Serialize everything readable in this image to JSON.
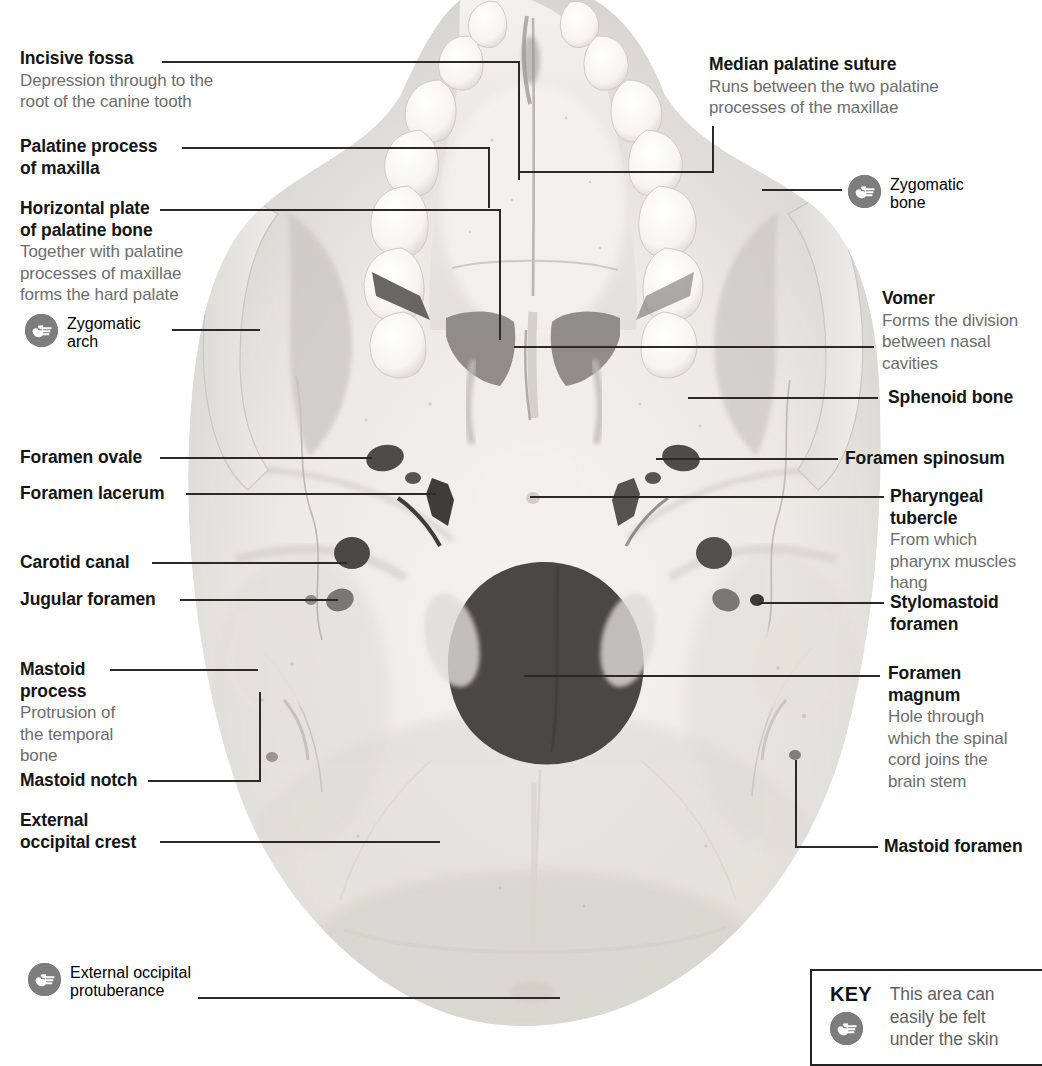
{
  "figure": {
    "bone_color": "#eceae6",
    "foramen_color": "#4a4a4a",
    "leader_color": "#2a2a2a",
    "title_color": "#151515",
    "desc_color": "#6d6d6d",
    "icon_color": "#7d7d7d"
  },
  "labels_left": [
    {
      "id": "incisive-fossa",
      "title": "Incisive fossa",
      "desc": "Depression through to the\nroot of the canine tooth",
      "touch": false
    },
    {
      "id": "palatine-process-of-maxilla",
      "title": "Palatine process\nof maxilla",
      "desc": "",
      "touch": false
    },
    {
      "id": "horizontal-plate-of-palatine-bone",
      "title": "Horizontal plate\nof palatine bone",
      "desc": "Together with palatine\nprocesses of maxillae\nforms the hard palate",
      "touch": false
    },
    {
      "id": "zygomatic-arch",
      "title": "Zygomatic\narch",
      "desc": "",
      "touch": true
    },
    {
      "id": "foramen-ovale",
      "title": "Foramen ovale",
      "desc": "",
      "touch": false
    },
    {
      "id": "foramen-lacerum",
      "title": "Foramen lacerum",
      "desc": "",
      "touch": false
    },
    {
      "id": "carotid-canal",
      "title": "Carotid canal",
      "desc": "",
      "touch": false
    },
    {
      "id": "jugular-foramen",
      "title": "Jugular foramen",
      "desc": "",
      "touch": false
    },
    {
      "id": "mastoid-process",
      "title": "Mastoid\nprocess",
      "desc": "Protrusion of\nthe temporal\nbone",
      "touch": false
    },
    {
      "id": "mastoid-notch",
      "title": "Mastoid notch",
      "desc": "",
      "touch": false
    },
    {
      "id": "external-occipital-crest",
      "title": "External\noccipital crest",
      "desc": "",
      "touch": false
    },
    {
      "id": "external-occipital-protuberance",
      "title": "External occipital\nprotuberance",
      "desc": "",
      "touch": true
    }
  ],
  "labels_right": [
    {
      "id": "median-palatine-suture",
      "title": "Median palatine suture",
      "desc": "Runs between the two palatine\nprocesses of the maxillae",
      "touch": false
    },
    {
      "id": "zygomatic-bone",
      "title": "Zygomatic\nbone",
      "desc": "",
      "touch": true
    },
    {
      "id": "vomer",
      "title": "Vomer",
      "desc": "Forms the division\nbetween nasal\ncavities",
      "touch": false
    },
    {
      "id": "sphenoid-bone",
      "title": "Sphenoid bone",
      "desc": "",
      "touch": false
    },
    {
      "id": "foramen-spinosum",
      "title": "Foramen spinosum",
      "desc": "",
      "touch": false
    },
    {
      "id": "pharyngeal-tubercle",
      "title": "Pharyngeal\ntubercle",
      "desc": "From which\npharynx muscles\nhang",
      "touch": false
    },
    {
      "id": "stylomastoid-foramen",
      "title": "Stylomastoid\nforamen",
      "desc": "",
      "touch": false
    },
    {
      "id": "foramen-magnum",
      "title": "Foramen\nmagnum",
      "desc": "Hole through\nwhich the spinal\ncord joins the\nbrain stem",
      "touch": false
    },
    {
      "id": "mastoid-foramen",
      "title": "Mastoid foramen",
      "desc": "",
      "touch": false
    }
  ],
  "key": {
    "word": "KEY",
    "text": "This area can\neasily be felt\nunder the skin",
    "icon": "pointing-hand-icon"
  }
}
